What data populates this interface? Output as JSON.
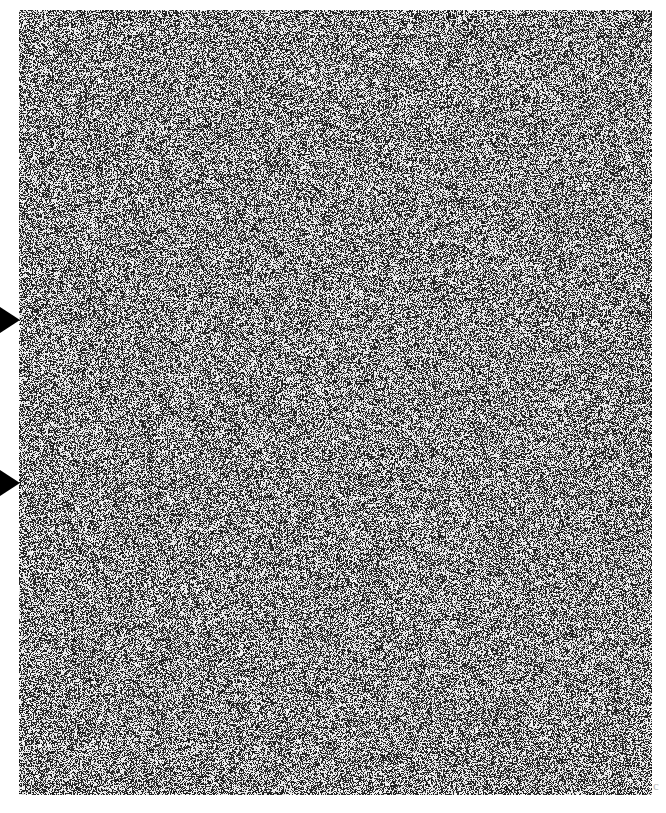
{
  "page": {
    "width": 666,
    "height": 813,
    "background_color": "#ffffff",
    "description": "Scanned page consisting almost entirely of a dense binary dither noise field, with two solid black triangular margin pointers on the left edge."
  },
  "noise_plate": {
    "name": "dither-noise-field",
    "x": 19,
    "y": 10,
    "width": 633,
    "height": 785,
    "ink_color": "#111111",
    "paper_color": "#ffffff",
    "density": 0.5,
    "cell_size": 1,
    "texture": "binary salt-and-pepper dither",
    "caption": ""
  },
  "margin_markers": [
    {
      "name": "margin-pointer-upper",
      "label": "",
      "x": 0,
      "y": 307,
      "width": 20,
      "height": 26,
      "center_y": 320,
      "color": "#000000",
      "direction": "right"
    },
    {
      "name": "margin-pointer-lower",
      "label": "",
      "x": 0,
      "y": 470,
      "width": 20,
      "height": 26,
      "center_y": 483,
      "color": "#000000",
      "direction": "right"
    }
  ],
  "edge_glyph": {
    "text": "c",
    "x": 653,
    "y": 779,
    "color": "#b9b9b9"
  }
}
